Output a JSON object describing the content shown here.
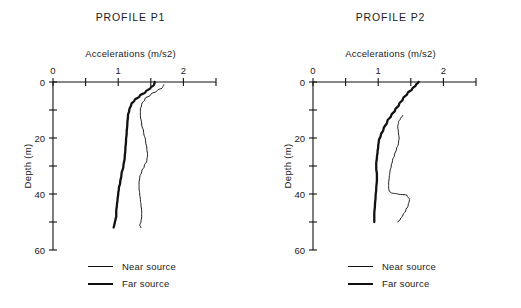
{
  "figure": {
    "background_color": "#ffffff",
    "line_color": "#111111"
  },
  "panels": [
    {
      "id": "p1",
      "title": "PROFILE P1",
      "x_axis_title": "Accelerations (m/s2)",
      "y_axis_title": "Depth (m)",
      "x_tick_labels": [
        "0",
        "1",
        "2"
      ],
      "y_tick_labels": [
        "0",
        "20",
        "40",
        "60"
      ],
      "legend": [
        {
          "label": "Near source",
          "style": "thin"
        },
        {
          "label": "Far source",
          "style": "thick"
        }
      ]
    },
    {
      "id": "p2",
      "title": "PROFILE P2",
      "x_axis_title": "Accelerations (m/s2)",
      "y_axis_title": "Depth (m)",
      "x_tick_labels": [
        "0",
        "1",
        "2"
      ],
      "y_tick_labels": [
        "0",
        "20",
        "40",
        "60"
      ],
      "legend": [
        {
          "label": "Near source",
          "style": "thin"
        },
        {
          "label": "Far source",
          "style": "thick"
        }
      ]
    }
  ],
  "chart_data": [
    {
      "type": "line",
      "title": "PROFILE P1",
      "xlabel": "Accelerations (m/s2)",
      "ylabel": "Depth (m)",
      "xlim": [
        0,
        2.5
      ],
      "ylim": [
        0,
        60
      ],
      "y_inverted": true,
      "grid": false,
      "legend_position": "below",
      "x_ticks": [
        0,
        0.5,
        1,
        1.5,
        2,
        2.5
      ],
      "x_tick_labels": [
        "0",
        "",
        "1",
        "",
        "2",
        ""
      ],
      "y_ticks": [
        0,
        10,
        20,
        30,
        40,
        50,
        60
      ],
      "y_tick_labels": [
        "0",
        "",
        "20",
        "",
        "40",
        "",
        "60"
      ],
      "series": [
        {
          "name": "Near source",
          "style": "thin",
          "x": [
            1.7,
            1.68,
            1.6,
            1.5,
            1.41,
            1.36,
            1.34,
            1.34,
            1.36,
            1.39,
            1.42,
            1.44,
            1.45,
            1.44,
            1.4,
            1.36,
            1.33,
            1.32,
            1.32,
            1.33,
            1.34,
            1.35,
            1.36,
            1.36,
            1.35,
            1.33,
            1.35
          ],
          "depth": [
            1,
            2,
            3,
            4.5,
            6,
            8,
            10,
            12,
            15,
            18,
            21,
            24,
            26,
            28,
            30,
            32,
            34,
            36,
            38,
            40,
            42,
            44,
            46,
            48,
            50,
            51,
            52
          ]
        },
        {
          "name": "Far source",
          "style": "thick",
          "x": [
            1.56,
            1.55,
            1.5,
            1.42,
            1.33,
            1.25,
            1.2,
            1.17,
            1.15,
            1.14,
            1.13,
            1.12,
            1.11,
            1.1,
            1.08,
            1.05,
            1.03,
            1.01,
            1.0,
            0.99,
            0.98,
            0.97,
            0.97,
            0.96,
            0.95,
            0.94,
            0.93
          ],
          "depth": [
            0,
            1,
            2,
            3.5,
            5,
            6.5,
            8,
            10,
            12,
            15,
            18,
            21,
            24,
            27,
            30,
            33,
            36,
            38,
            40,
            42,
            44,
            46,
            48,
            49,
            50,
            51,
            52
          ]
        }
      ]
    },
    {
      "type": "line",
      "title": "PROFILE P2",
      "xlabel": "Accelerations (m/s2)",
      "ylabel": "Depth (m)",
      "xlim": [
        0,
        2.5
      ],
      "ylim": [
        0,
        60
      ],
      "y_inverted": true,
      "grid": false,
      "legend_position": "below",
      "x_ticks": [
        0,
        0.5,
        1,
        1.5,
        2,
        2.5
      ],
      "x_tick_labels": [
        "0",
        "",
        "1",
        "",
        "2",
        ""
      ],
      "y_ticks": [
        0,
        10,
        20,
        30,
        40,
        50,
        60
      ],
      "y_tick_labels": [
        "0",
        "",
        "20",
        "",
        "40",
        "",
        "60"
      ],
      "series": [
        {
          "name": "Near source",
          "style": "thin",
          "x": [
            1.38,
            1.34,
            1.31,
            1.3,
            1.31,
            1.32,
            1.31,
            1.28,
            1.25,
            1.22,
            1.2,
            1.18,
            1.17,
            1.16,
            1.16,
            1.17,
            1.2,
            1.3,
            1.44,
            1.48,
            1.46,
            1.42,
            1.38,
            1.34,
            1.3
          ],
          "depth": [
            12,
            13,
            14.5,
            16,
            18,
            20,
            22,
            24,
            26,
            28,
            30,
            32,
            34,
            36,
            38,
            39,
            39.6,
            40,
            40.4,
            42,
            44,
            46,
            47.5,
            49,
            50
          ]
        },
        {
          "name": "Far source",
          "style": "thick",
          "x": [
            1.62,
            1.58,
            1.52,
            1.45,
            1.38,
            1.32,
            1.26,
            1.2,
            1.14,
            1.08,
            1.04,
            1.01,
            1.0,
            0.99,
            0.98,
            0.97,
            0.97,
            0.98,
            0.98,
            0.97,
            0.96,
            0.95,
            0.94,
            0.94
          ],
          "depth": [
            0,
            1,
            2.5,
            4,
            6,
            8,
            10,
            12,
            14,
            17,
            19,
            21,
            23,
            25,
            27,
            29,
            31,
            33,
            35,
            38,
            41,
            44,
            47,
            50
          ]
        }
      ]
    }
  ]
}
